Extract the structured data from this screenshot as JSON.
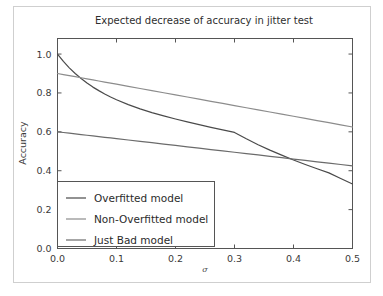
{
  "figure": {
    "background_color": "#ffffff",
    "border_color": "#cfcfcf",
    "axes_color": "#555555"
  },
  "chart_data": {
    "type": "line",
    "title": "Expected decrease of accuracy in jitter test",
    "xlabel": "σ",
    "ylabel": "Accuracy",
    "xlim": [
      0.0,
      0.5
    ],
    "ylim": [
      0.0,
      1.08
    ],
    "grid": false,
    "legend_position": "lower left",
    "xticks": [
      0.0,
      0.1,
      0.2,
      0.3,
      0.4,
      0.5
    ],
    "xtick_labels": [
      "0.0",
      "0.1",
      "0.2",
      "0.3",
      "0.4",
      "0.5"
    ],
    "yticks": [
      0.0,
      0.2,
      0.4,
      0.6,
      0.8,
      1.0
    ],
    "ytick_labels": [
      "0.0",
      "0.2",
      "0.4",
      "0.6",
      "0.8",
      "1.0"
    ],
    "x": [
      0.0,
      0.01,
      0.02,
      0.03,
      0.04,
      0.05,
      0.06,
      0.07,
      0.08,
      0.09,
      0.1,
      0.12,
      0.14,
      0.16,
      0.18,
      0.2,
      0.22,
      0.24,
      0.26,
      0.28,
      0.3,
      0.32,
      0.34,
      0.36,
      0.38,
      0.4,
      0.42,
      0.44,
      0.46,
      0.48,
      0.5
    ],
    "series": [
      {
        "name": "Overfitted model",
        "color": "#4a4a4a",
        "linewidth": 1.2,
        "values": [
          1.0,
          0.962,
          0.929,
          0.9,
          0.874,
          0.851,
          0.83,
          0.812,
          0.795,
          0.779,
          0.765,
          0.74,
          0.718,
          0.699,
          0.682,
          0.666,
          0.651,
          0.637,
          0.623,
          0.61,
          0.597,
          0.564,
          0.534,
          0.506,
          0.48,
          0.455,
          0.432,
          0.41,
          0.389,
          0.36,
          0.332
        ]
      },
      {
        "name": "Non-Overfitted model",
        "color": "#8c8c8c",
        "linewidth": 1.2,
        "values": [
          0.9,
          0.8945,
          0.889,
          0.8835,
          0.878,
          0.8725,
          0.867,
          0.8615,
          0.856,
          0.8505,
          0.845,
          0.834,
          0.823,
          0.812,
          0.801,
          0.79,
          0.779,
          0.768,
          0.757,
          0.746,
          0.735,
          0.724,
          0.713,
          0.702,
          0.691,
          0.68,
          0.669,
          0.658,
          0.647,
          0.636,
          0.625
        ]
      },
      {
        "name": "Just Bad model",
        "color": "#6b6b6b",
        "linewidth": 1.2,
        "values": [
          0.6,
          0.5965,
          0.593,
          0.5895,
          0.586,
          0.5825,
          0.579,
          0.5755,
          0.572,
          0.5685,
          0.565,
          0.558,
          0.551,
          0.544,
          0.537,
          0.53,
          0.523,
          0.516,
          0.509,
          0.502,
          0.495,
          0.488,
          0.481,
          0.474,
          0.467,
          0.46,
          0.453,
          0.446,
          0.439,
          0.432,
          0.425
        ]
      }
    ]
  }
}
